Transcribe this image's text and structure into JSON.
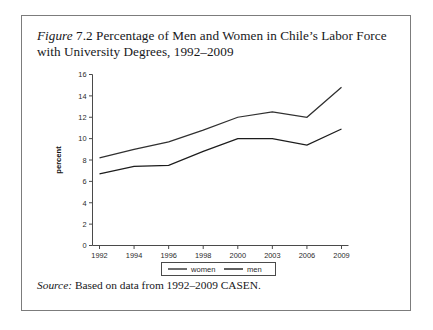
{
  "figure": {
    "label": "Figure",
    "number": "7.2",
    "caption": "Percentage of Men and Women in Chile’s Labor Force with University Degrees, 1992–2009",
    "caption_full": "Figure 7.2 Percentage of Men and Women in Chile’s Labor Force with University Degrees, 1992–2009"
  },
  "source": {
    "label": "Source:",
    "text": "Based on data from 1992–2009 CASEN."
  },
  "colors": {
    "frame": "#7c7c7c",
    "axis": "#4a4a4a",
    "women_line": "#303030",
    "men_line": "#1c1c1c",
    "background": "#ffffff",
    "text": "#17171a"
  },
  "legend": {
    "position": "below-axis-center",
    "entries": [
      {
        "label": "women",
        "color": "#303030"
      },
      {
        "label": "men",
        "color": "#1c1c1c"
      }
    ]
  },
  "chart_data": {
    "type": "line",
    "title": "Percentage of Men and Women in Chile’s Labor Force with University Degrees, 1992–2009",
    "xlabel": "",
    "ylabel": "percent",
    "categories": [
      "1992",
      "1994",
      "1996",
      "1998",
      "2000",
      "2003",
      "2006",
      "2009"
    ],
    "x_tick_labels": [
      "1992",
      "1994",
      "1996",
      "1998",
      "2000",
      "2003",
      "2006",
      "2009"
    ],
    "y_tick_labels": [
      "0",
      "2",
      "4",
      "6",
      "8",
      "10",
      "12",
      "14",
      "16"
    ],
    "y_ticks": [
      0,
      2,
      4,
      6,
      8,
      10,
      12,
      14,
      16
    ],
    "ylim": [
      0,
      16
    ],
    "grid": false,
    "legend_position": "bottom-center",
    "series": [
      {
        "name": "women",
        "color": "#303030",
        "values": [
          8.2,
          9.0,
          9.7,
          10.8,
          12.0,
          12.5,
          12.0,
          14.8
        ]
      },
      {
        "name": "men",
        "color": "#1c1c1c",
        "values": [
          6.7,
          7.4,
          7.5,
          8.8,
          10.0,
          10.0,
          9.4,
          10.9
        ]
      }
    ]
  }
}
